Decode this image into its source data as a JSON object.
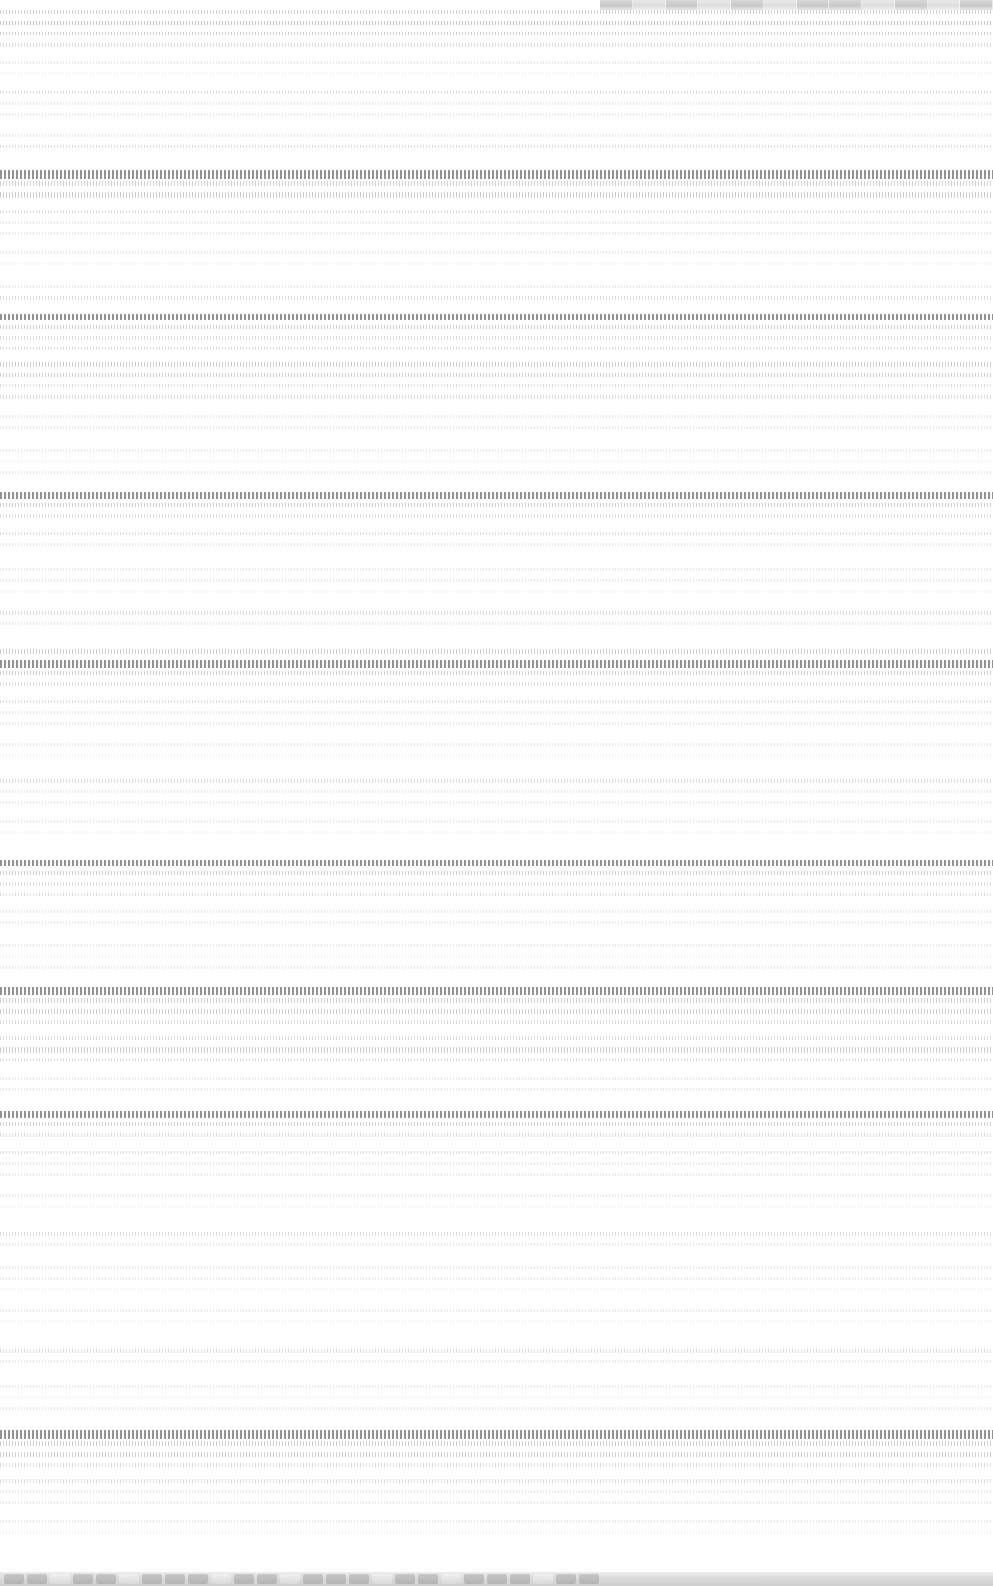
{
  "note_on_legibility": "Source screenshot is destroyed by horizontal motion blur; no glyph, label, number or icon is recoverable at any zoom level. Only band geometry is recorded below — no text is invented.",
  "canvas": {
    "width": 993,
    "height": 1586,
    "background": "#ffffff"
  },
  "top_chrome": {
    "present": true,
    "y": 0,
    "height": 10,
    "x_start": 600,
    "width": 393,
    "base_color": "#c9c9c9",
    "segment_count": 12,
    "bright_segments": [
      1,
      3,
      5,
      8,
      10
    ]
  },
  "document": {
    "y": 10,
    "height": 1562,
    "left_margin": 0,
    "right_margin": 0,
    "text_color_apparent": "#77777c",
    "line_pitch_px": 11,
    "blocks": [
      {
        "lines": [
          {
            "h": 4,
            "d": 4
          },
          {
            "h": 4,
            "d": 5
          },
          {
            "h": 3,
            "d": 4
          },
          {
            "h": 4,
            "d": 3
          }
        ],
        "gap": 14
      },
      {
        "lines": [
          {
            "h": 3,
            "d": 2
          },
          {
            "h": 3,
            "d": 1
          }
        ],
        "gap": 16
      },
      {
        "lines": [
          {
            "h": 3,
            "d": 3
          },
          {
            "h": 3,
            "d": 2
          },
          {
            "h": 3,
            "d": 2
          }
        ],
        "gap": 18
      },
      {
        "lines": [
          {
            "h": 3,
            "d": 2
          },
          {
            "h": 3,
            "d": 3
          }
        ],
        "gap": 22
      },
      {
        "lines": [
          {
            "h": 9,
            "d": 5,
            "head": true
          },
          {
            "h": 5,
            "d": 4
          },
          {
            "h": 6,
            "d": 4
          }
        ],
        "gap": 12
      },
      {
        "lines": [
          {
            "h": 3,
            "d": 3
          },
          {
            "h": 3,
            "d": 2
          },
          {
            "h": 3,
            "d": 2
          }
        ],
        "gap": 16
      },
      {
        "lines": [
          {
            "h": 3,
            "d": 2
          },
          {
            "h": 3,
            "d": 1
          }
        ],
        "gap": 20
      },
      {
        "lines": [
          {
            "h": 3,
            "d": 2
          },
          {
            "h": 4,
            "d": 3
          }
        ],
        "gap": 14
      },
      {
        "lines": [
          {
            "h": 6,
            "d": 5,
            "head": true
          },
          {
            "h": 4,
            "d": 4
          },
          {
            "h": 4,
            "d": 3
          },
          {
            "h": 3,
            "d": 3
          }
        ],
        "gap": 12
      },
      {
        "lines": [
          {
            "h": 5,
            "d": 4
          },
          {
            "h": 4,
            "d": 4
          },
          {
            "h": 3,
            "d": 3
          },
          {
            "h": 4,
            "d": 3
          }
        ],
        "gap": 16
      },
      {
        "lines": [
          {
            "h": 3,
            "d": 2
          },
          {
            "h": 3,
            "d": 2
          }
        ],
        "gap": 20
      },
      {
        "lines": [
          {
            "h": 3,
            "d": 2
          },
          {
            "h": 3,
            "d": 1
          },
          {
            "h": 3,
            "d": 2
          }
        ],
        "gap": 18
      },
      {
        "lines": [
          {
            "h": 7,
            "d": 5,
            "head": true
          },
          {
            "h": 4,
            "d": 4
          },
          {
            "h": 4,
            "d": 3
          }
        ],
        "gap": 14
      },
      {
        "lines": [
          {
            "h": 3,
            "d": 3
          },
          {
            "h": 3,
            "d": 2
          }
        ],
        "gap": 22
      },
      {
        "lines": [
          {
            "h": 3,
            "d": 2
          },
          {
            "h": 3,
            "d": 2
          },
          {
            "h": 3,
            "d": 1
          }
        ],
        "gap": 18
      },
      {
        "lines": [
          {
            "h": 4,
            "d": 3
          },
          {
            "h": 3,
            "d": 2
          }
        ],
        "gap": 24
      },
      {
        "lines": [
          {
            "h": 5,
            "d": 4
          },
          {
            "h": 8,
            "d": 5,
            "head": true
          },
          {
            "h": 4,
            "d": 4
          },
          {
            "h": 4,
            "d": 3
          }
        ],
        "gap": 14
      },
      {
        "lines": [
          {
            "h": 3,
            "d": 3
          },
          {
            "h": 3,
            "d": 2
          },
          {
            "h": 3,
            "d": 2
          }
        ],
        "gap": 18
      },
      {
        "lines": [
          {
            "h": 3,
            "d": 2
          },
          {
            "h": 3,
            "d": 1
          }
        ],
        "gap": 22
      },
      {
        "lines": [
          {
            "h": 4,
            "d": 3
          },
          {
            "h": 3,
            "d": 2
          },
          {
            "h": 3,
            "d": 2
          }
        ],
        "gap": 16
      },
      {
        "lines": [
          {
            "h": 3,
            "d": 2
          },
          {
            "h": 3,
            "d": 1
          }
        ],
        "gap": 26
      },
      {
        "lines": [
          {
            "h": 6,
            "d": 5,
            "head": true
          },
          {
            "h": 4,
            "d": 4
          },
          {
            "h": 4,
            "d": 3
          },
          {
            "h": 3,
            "d": 3
          }
        ],
        "gap": 14
      },
      {
        "lines": [
          {
            "h": 3,
            "d": 2
          },
          {
            "h": 3,
            "d": 2
          }
        ],
        "gap": 20
      },
      {
        "lines": [
          {
            "h": 3,
            "d": 2
          },
          {
            "h": 3,
            "d": 1
          },
          {
            "h": 3,
            "d": 2
          }
        ],
        "gap": 18
      },
      {
        "lines": [
          {
            "h": 8,
            "d": 5,
            "head": true
          },
          {
            "h": 5,
            "d": 4
          },
          {
            "h": 5,
            "d": 4
          },
          {
            "h": 4,
            "d": 3
          }
        ],
        "gap": 12
      },
      {
        "lines": [
          {
            "h": 4,
            "d": 3
          },
          {
            "h": 6,
            "d": 4
          },
          {
            "h": 3,
            "d": 3
          }
        ],
        "gap": 16
      },
      {
        "lines": [
          {
            "h": 3,
            "d": 2
          },
          {
            "h": 3,
            "d": 2
          }
        ],
        "gap": 20
      },
      {
        "lines": [
          {
            "h": 7,
            "d": 5,
            "head": true
          },
          {
            "h": 4,
            "d": 4
          },
          {
            "h": 4,
            "d": 3
          }
        ],
        "gap": 14
      },
      {
        "lines": [
          {
            "h": 3,
            "d": 3
          },
          {
            "h": 3,
            "d": 2
          },
          {
            "h": 3,
            "d": 2
          }
        ],
        "gap": 18
      },
      {
        "lines": [
          {
            "h": 3,
            "d": 2
          },
          {
            "h": 3,
            "d": 1
          }
        ],
        "gap": 24
      },
      {
        "lines": [
          {
            "h": 4,
            "d": 3
          },
          {
            "h": 3,
            "d": 2
          }
        ],
        "gap": 20
      },
      {
        "lines": [
          {
            "h": 3,
            "d": 2
          },
          {
            "h": 3,
            "d": 2
          },
          {
            "h": 3,
            "d": 1
          }
        ],
        "gap": 18
      },
      {
        "lines": [
          {
            "h": 3,
            "d": 2
          },
          {
            "h": 3,
            "d": 1
          }
        ],
        "gap": 26
      },
      {
        "lines": [
          {
            "h": 4,
            "d": 3
          },
          {
            "h": 3,
            "d": 2
          }
        ],
        "gap": 22
      },
      {
        "lines": [
          {
            "h": 3,
            "d": 2
          },
          {
            "h": 3,
            "d": 1
          },
          {
            "h": 3,
            "d": 2
          }
        ],
        "gap": 20
      },
      {
        "lines": [
          {
            "h": 9,
            "d": 5,
            "head": true
          },
          {
            "h": 5,
            "d": 4
          },
          {
            "h": 5,
            "d": 4
          },
          {
            "h": 4,
            "d": 3
          }
        ],
        "gap": 12
      },
      {
        "lines": [
          {
            "h": 4,
            "d": 3
          },
          {
            "h": 3,
            "d": 2
          },
          {
            "h": 3,
            "d": 2
          }
        ],
        "gap": 16
      },
      {
        "lines": [
          {
            "h": 3,
            "d": 2
          },
          {
            "h": 3,
            "d": 1
          }
        ],
        "gap": 18
      }
    ]
  },
  "dock": {
    "present": true,
    "y": 1572,
    "height": 14,
    "background": "#d4d4d4",
    "icon_count": 26,
    "bright_icon_indices": [
      2,
      5,
      9,
      12,
      16,
      19,
      23
    ]
  }
}
